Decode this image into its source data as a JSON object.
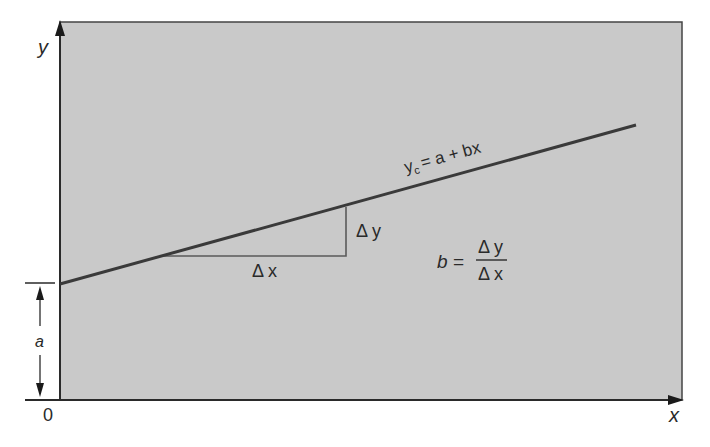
{
  "diagram": {
    "colors": {
      "background": "#ffffff",
      "plot_fill": "#c9c9c9",
      "axis": "#2a2a2a",
      "regression_line": "#3a3a3a",
      "triangle": "#5a5a5a",
      "text": "#2a2a2a"
    },
    "axes": {
      "x_label": "x",
      "y_label": "y",
      "origin_label": "0"
    },
    "intercept": {
      "label": "a"
    },
    "equation": {
      "lhs": "y",
      "lhs_subscript": "c",
      "rhs": "= a + bx"
    },
    "slope_triangle": {
      "dx_label": "Δ x",
      "dy_label": "Δ y"
    },
    "slope_formula": {
      "lhs": "b =",
      "numerator": "Δ y",
      "denominator": "Δ x"
    }
  }
}
